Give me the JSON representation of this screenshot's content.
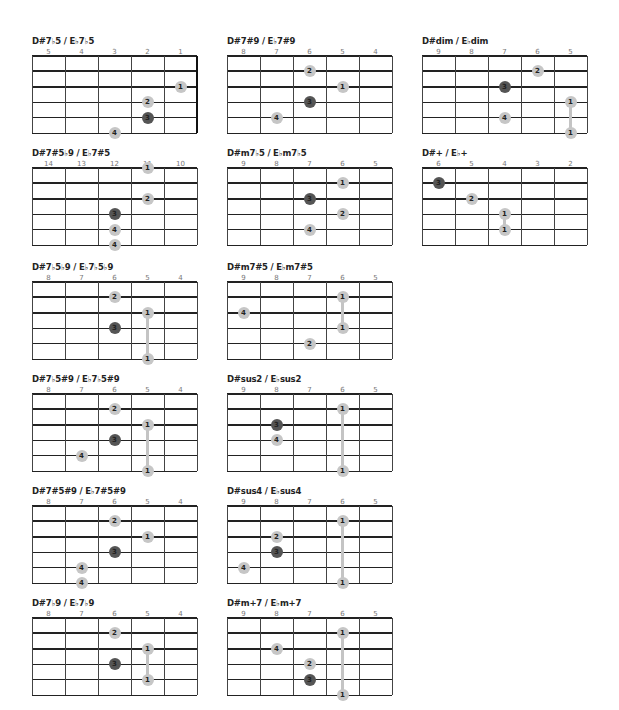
{
  "chords": [
    {
      "title": "D#7♭5 / E♭7♭5",
      "frets": [
        "5",
        "4",
        "3",
        "2",
        "1"
      ],
      "nut_right": true,
      "x": 32,
      "y": 36,
      "dots": [
        {
          "f": "1",
          "c": 4,
          "s": 2
        },
        {
          "f": "2",
          "c": 3,
          "s": 3
        },
        {
          "f": "3",
          "c": 3,
          "s": 4,
          "dark": true
        },
        {
          "f": "4",
          "c": 2,
          "s": 5
        }
      ],
      "barres": []
    },
    {
      "title": "D#7#9 / E♭7#9",
      "frets": [
        "8",
        "7",
        "6",
        "5",
        "4"
      ],
      "x": 227,
      "y": 36,
      "dots": [
        {
          "f": "2",
          "c": 2,
          "s": 1
        },
        {
          "f": "1",
          "c": 3,
          "s": 2
        },
        {
          "f": "3",
          "c": 2,
          "s": 3,
          "dark": true
        },
        {
          "f": "4",
          "c": 1,
          "s": 4
        }
      ],
      "barres": []
    },
    {
      "title": "D#dim / E♭dim",
      "frets": [
        "9",
        "8",
        "7",
        "6",
        "5"
      ],
      "x": 422,
      "y": 36,
      "dots": [
        {
          "f": "2",
          "c": 3,
          "s": 1
        },
        {
          "f": "3",
          "c": 2,
          "s": 2,
          "dark": true
        },
        {
          "f": "1",
          "c": 4,
          "s": 3
        },
        {
          "f": "4",
          "c": 2,
          "s": 4
        },
        {
          "f": "1",
          "c": 4,
          "s": 5
        }
      ],
      "barres": [
        {
          "c": 4,
          "from": 3,
          "to": 5
        }
      ]
    },
    {
      "title": "D#7#5♭9 / E♭7#5",
      "frets": [
        "14",
        "13",
        "12",
        "11",
        "10"
      ],
      "x": 32,
      "y": 148,
      "dots": [
        {
          "f": "1",
          "c": 3,
          "s": 0
        },
        {
          "f": "2",
          "c": 3,
          "s": 2
        },
        {
          "f": "3",
          "c": 2,
          "s": 3,
          "dark": true
        },
        {
          "f": "4",
          "c": 2,
          "s": 4
        },
        {
          "f": "4",
          "c": 2,
          "s": 5
        }
      ],
      "barres": []
    },
    {
      "title": "D#m7♭5 / E♭m7♭5",
      "frets": [
        "9",
        "8",
        "7",
        "6",
        "5"
      ],
      "x": 227,
      "y": 148,
      "dots": [
        {
          "f": "1",
          "c": 3,
          "s": 1
        },
        {
          "f": "3",
          "c": 2,
          "s": 2,
          "dark": true
        },
        {
          "f": "2",
          "c": 3,
          "s": 3
        },
        {
          "f": "4",
          "c": 2,
          "s": 4
        }
      ],
      "barres": []
    },
    {
      "title": "D#+ / E♭+",
      "frets": [
        "6",
        "5",
        "4",
        "3",
        "2"
      ],
      "x": 422,
      "y": 148,
      "dots": [
        {
          "f": "3",
          "c": 0,
          "s": 1,
          "dark": true
        },
        {
          "f": "2",
          "c": 1,
          "s": 2
        },
        {
          "f": "1",
          "c": 2,
          "s": 3
        },
        {
          "f": "1",
          "c": 2,
          "s": 4
        }
      ],
      "barres": [
        {
          "c": 2,
          "from": 3,
          "to": 4
        }
      ]
    },
    {
      "title": "D#7♭5♭9 / E♭7♭5♭9",
      "frets": [
        "8",
        "7",
        "6",
        "5",
        "4"
      ],
      "x": 32,
      "y": 262,
      "dots": [
        {
          "f": "2",
          "c": 2,
          "s": 1
        },
        {
          "f": "1",
          "c": 3,
          "s": 2
        },
        {
          "f": "3",
          "c": 2,
          "s": 3,
          "dark": true
        },
        {
          "f": "1",
          "c": 3,
          "s": 5
        }
      ],
      "barres": [
        {
          "c": 3,
          "from": 2,
          "to": 5
        }
      ]
    },
    {
      "title": "D#m7#5 / E♭m7#5",
      "frets": [
        "9",
        "8",
        "7",
        "6",
        "5"
      ],
      "x": 227,
      "y": 262,
      "dots": [
        {
          "f": "1",
          "c": 3,
          "s": 1
        },
        {
          "f": "4",
          "c": 0,
          "s": 2
        },
        {
          "f": "1",
          "c": 3,
          "s": 3
        },
        {
          "f": "2",
          "c": 2,
          "s": 4
        }
      ],
      "barres": [
        {
          "c": 3,
          "from": 1,
          "to": 3
        }
      ]
    },
    {
      "title": "D#7♭5#9 / E♭7♭5#9",
      "frets": [
        "8",
        "7",
        "6",
        "5",
        "4"
      ],
      "x": 32,
      "y": 374,
      "dots": [
        {
          "f": "2",
          "c": 2,
          "s": 1
        },
        {
          "f": "1",
          "c": 3,
          "s": 2
        },
        {
          "f": "3",
          "c": 2,
          "s": 3,
          "dark": true
        },
        {
          "f": "4",
          "c": 1,
          "s": 4
        },
        {
          "f": "1",
          "c": 3,
          "s": 5
        }
      ],
      "barres": [
        {
          "c": 3,
          "from": 2,
          "to": 5
        }
      ]
    },
    {
      "title": "D#sus2 / E♭sus2",
      "frets": [
        "9",
        "8",
        "7",
        "6",
        "5"
      ],
      "x": 227,
      "y": 374,
      "dots": [
        {
          "f": "1",
          "c": 3,
          "s": 1
        },
        {
          "f": "3",
          "c": 1,
          "s": 2,
          "dark": true
        },
        {
          "f": "4",
          "c": 1,
          "s": 3
        },
        {
          "f": "1",
          "c": 3,
          "s": 5
        }
      ],
      "barres": [
        {
          "c": 3,
          "from": 1,
          "to": 5
        }
      ]
    },
    {
      "title": "D#7#5#9 / E♭7#5#9",
      "frets": [
        "8",
        "7",
        "6",
        "5",
        "4"
      ],
      "x": 32,
      "y": 486,
      "dots": [
        {
          "f": "2",
          "c": 2,
          "s": 1
        },
        {
          "f": "1",
          "c": 3,
          "s": 2
        },
        {
          "f": "3",
          "c": 2,
          "s": 3,
          "dark": true
        },
        {
          "f": "4",
          "c": 1,
          "s": 4
        },
        {
          "f": "4",
          "c": 1,
          "s": 5
        }
      ],
      "barres": []
    },
    {
      "title": "D#sus4 / E♭sus4",
      "frets": [
        "9",
        "8",
        "7",
        "6",
        "5"
      ],
      "x": 227,
      "y": 486,
      "dots": [
        {
          "f": "1",
          "c": 3,
          "s": 1
        },
        {
          "f": "2",
          "c": 1,
          "s": 2
        },
        {
          "f": "3",
          "c": 1,
          "s": 3,
          "dark": true
        },
        {
          "f": "4",
          "c": 0,
          "s": 4
        },
        {
          "f": "1",
          "c": 3,
          "s": 5
        }
      ],
      "barres": [
        {
          "c": 3,
          "from": 1,
          "to": 5
        }
      ]
    },
    {
      "title": "D#7♭9 / E♭7♭9",
      "frets": [
        "8",
        "7",
        "6",
        "5",
        "4"
      ],
      "x": 32,
      "y": 598,
      "dots": [
        {
          "f": "2",
          "c": 2,
          "s": 1
        },
        {
          "f": "1",
          "c": 3,
          "s": 2
        },
        {
          "f": "3",
          "c": 2,
          "s": 3,
          "dark": true
        },
        {
          "f": "1",
          "c": 3,
          "s": 4
        }
      ],
      "barres": [
        {
          "c": 3,
          "from": 2,
          "to": 4
        }
      ]
    },
    {
      "title": "D#m+7 / E♭m+7",
      "frets": [
        "9",
        "8",
        "7",
        "6",
        "5"
      ],
      "x": 227,
      "y": 598,
      "dots": [
        {
          "f": "1",
          "c": 3,
          "s": 1
        },
        {
          "f": "4",
          "c": 1,
          "s": 2
        },
        {
          "f": "2",
          "c": 2,
          "s": 3
        },
        {
          "f": "3",
          "c": 2,
          "s": 4,
          "dark": true
        },
        {
          "f": "1",
          "c": 3,
          "s": 5
        }
      ],
      "barres": [
        {
          "c": 3,
          "from": 1,
          "to": 5
        }
      ]
    }
  ],
  "colors": {
    "dot_light": "#c6c6c6",
    "dot_dark": "#555555",
    "line": "#222222"
  }
}
